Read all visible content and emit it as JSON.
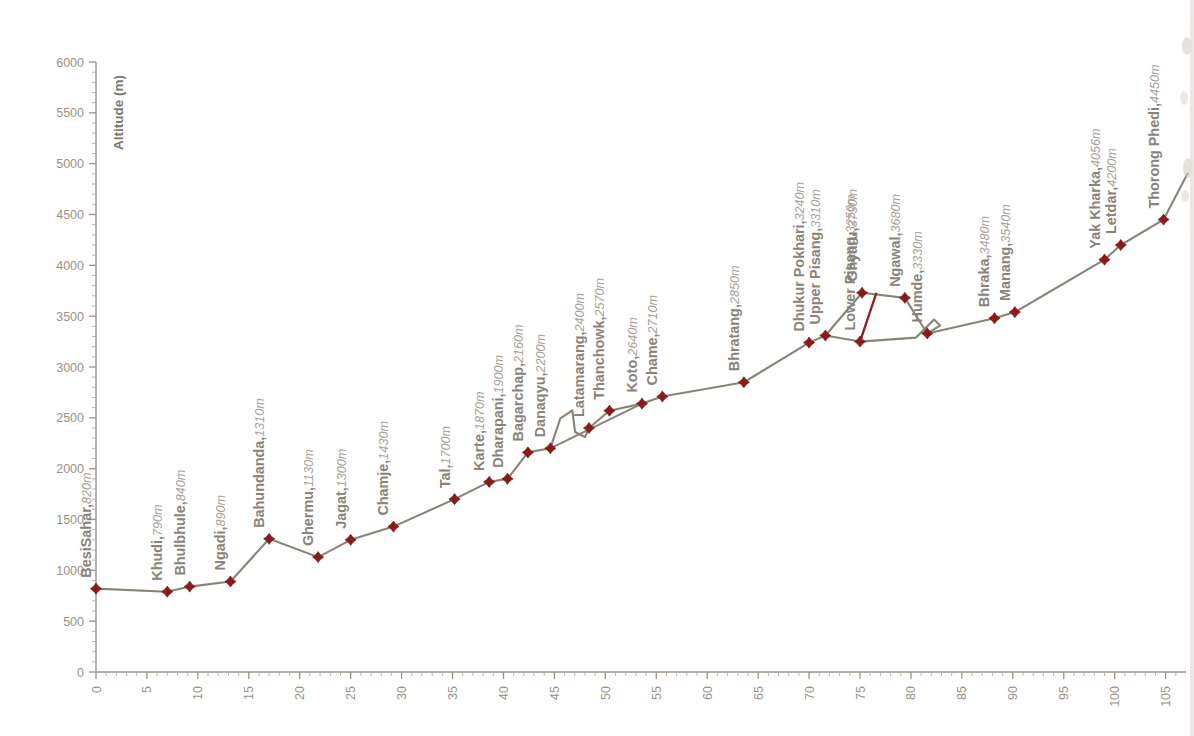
{
  "chart_data": {
    "type": "line",
    "title": "",
    "xlabel": "",
    "ylabel": "Altitude (m)",
    "xlim": [
      0,
      107
    ],
    "ylim": [
      0,
      6000
    ],
    "grid": false,
    "legend": "none",
    "x_ticks": [
      0,
      5,
      10,
      15,
      20,
      25,
      30,
      35,
      40,
      45,
      50,
      55,
      60,
      65,
      70,
      75,
      80,
      85,
      90,
      95,
      100,
      105
    ],
    "x_tick_labels": [
      "0",
      "5",
      "10",
      "15",
      "20",
      "25",
      "30",
      "35",
      "40",
      "45",
      "50",
      "55",
      "60",
      "65",
      "70",
      "75",
      "80",
      "85",
      "90",
      "95",
      "100",
      "105"
    ],
    "x_minor_step": 1,
    "y_ticks": [
      0,
      500,
      1000,
      1500,
      2000,
      2500,
      3000,
      3500,
      4000,
      4500,
      5000,
      5500,
      6000
    ],
    "y_tick_labels": [
      "0",
      "500",
      "1000",
      "1500",
      "2000",
      "2500",
      "3000",
      "3500",
      "4000",
      "4500",
      "5000",
      "5500",
      "6000"
    ],
    "y_minor_step": 100,
    "marker_color": "#8b1a1a",
    "line_color": "#8a8378",
    "link_color": "#8f1d1d",
    "label_color": "#8a8378",
    "alt_label_color": "#a8a199",
    "axis_color": "#9a9288",
    "series": [
      {
        "name": "Annapurna Circuit main trek profile",
        "points": [
          {
            "label": "BesiSahar",
            "altitude": 820,
            "altitude_text": "820m",
            "x": 0.0
          },
          {
            "label": "Khudi",
            "altitude": 790,
            "altitude_text": "790m",
            "x": 7.0
          },
          {
            "label": "Bhulbhule",
            "altitude": 840,
            "altitude_text": "840m",
            "x": 9.2
          },
          {
            "label": "Ngadi",
            "altitude": 890,
            "altitude_text": "890m",
            "x": 13.2
          },
          {
            "label": "Bahundanda",
            "altitude": 1310,
            "altitude_text": "1310m",
            "x": 17.0
          },
          {
            "label": "Ghermu",
            "altitude": 1130,
            "altitude_text": "1130m",
            "x": 21.8
          },
          {
            "label": "Jagat",
            "altitude": 1300,
            "altitude_text": "1300m",
            "x": 25.0
          },
          {
            "label": "Chamje",
            "altitude": 1430,
            "altitude_text": "1430m",
            "x": 29.2
          },
          {
            "label": "Tal",
            "altitude": 1700,
            "altitude_text": "1700m",
            "x": 35.2
          },
          {
            "label": "Karte",
            "altitude": 1870,
            "altitude_text": "1870m",
            "x": 38.6
          },
          {
            "label": "Dharapani",
            "altitude": 1900,
            "altitude_text": "1900m",
            "x": 40.4
          },
          {
            "label": "Bagarchap",
            "altitude": 2160,
            "altitude_text": "2160m",
            "x": 42.4
          },
          {
            "label": "Danaqyu",
            "altitude": 2200,
            "altitude_text": "2200m",
            "x": 44.6
          },
          {
            "label": "Latamarang",
            "altitude": 2400,
            "altitude_text": "2400m",
            "x": 48.4
          },
          {
            "label": "Thanchowk",
            "altitude": 2570,
            "altitude_text": "2570m",
            "x": 50.4
          },
          {
            "label": "Koto",
            "altitude": 2640,
            "altitude_text": "2640m",
            "x": 53.6
          },
          {
            "label": "Chame",
            "altitude": 2710,
            "altitude_text": "2710m",
            "x": 55.6
          },
          {
            "label": "Bhratang",
            "altitude": 2850,
            "altitude_text": "2850m",
            "x": 63.6
          },
          {
            "label": "Dhukur Pokhari",
            "altitude": 3240,
            "altitude_text": "3240m",
            "x": 70.0
          },
          {
            "label": "Upper Pisang",
            "altitude": 3310,
            "altitude_text": "3310m",
            "x": 71.6
          },
          {
            "label": "Ghyaru",
            "altitude": 3730,
            "altitude_text": "3730m",
            "x": 75.2
          },
          {
            "label": "Lower Pisang",
            "altitude": 3250,
            "altitude_text": "3250m",
            "x": 75.0
          },
          {
            "label": "Ngawal",
            "altitude": 3680,
            "altitude_text": "3680m",
            "x": 79.4
          },
          {
            "label": "Humde",
            "altitude": 3330,
            "altitude_text": "3330m",
            "x": 81.6
          },
          {
            "label": "Bhraka",
            "altitude": 3480,
            "altitude_text": "3480m",
            "x": 88.2
          },
          {
            "label": "Manang",
            "altitude": 3540,
            "altitude_text": "3540m",
            "x": 90.2
          },
          {
            "label": "Yak Kharka",
            "altitude": 4056,
            "altitude_text": "4056m",
            "x": 99.0
          },
          {
            "label": "Letdar",
            "altitude": 4200,
            "altitude_text": "4200m",
            "x": 100.6
          },
          {
            "label": "Thorong Phedi",
            "altitude": 4450,
            "altitude_text": "4450m",
            "x": 104.8
          }
        ]
      }
    ]
  }
}
